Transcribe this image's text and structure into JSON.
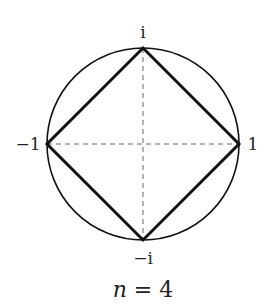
{
  "diagram": {
    "caption_var": "n",
    "caption_eq": " = ",
    "caption_val": "4",
    "labels": {
      "top": "i",
      "bottom": "−i",
      "left": "−1",
      "right": "1"
    },
    "geometry": {
      "center": [
        143,
        144
      ],
      "radius": 96,
      "vertices": [
        "1",
        "i",
        "-1",
        "-i"
      ]
    },
    "colors": {
      "stroke": "#111111",
      "axis": "#666666"
    }
  }
}
